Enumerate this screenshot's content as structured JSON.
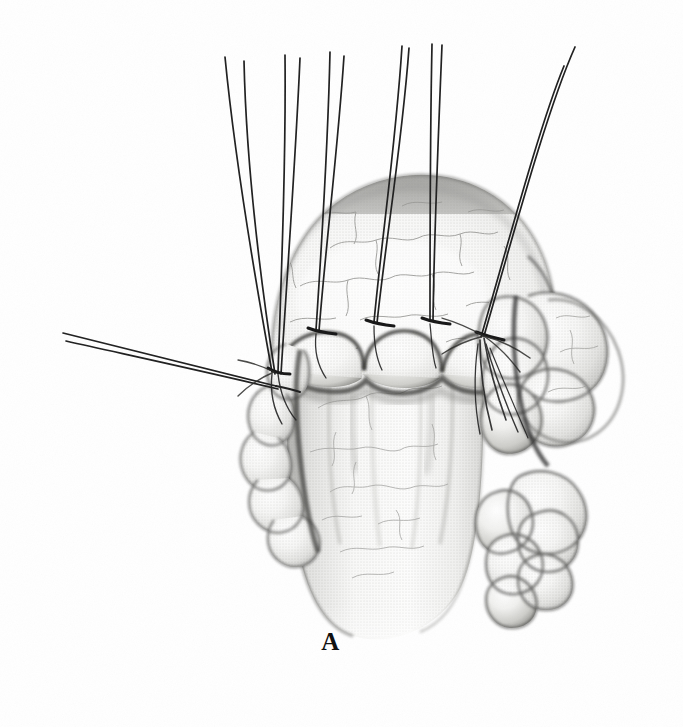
{
  "figure": {
    "kind": "medical-illustration",
    "modality": "grayscale stipple / halftone surgical drawing",
    "background_color": "#ffffff",
    "ink_color": "#1a1a1a",
    "tissue_light": "#f4f4f2",
    "tissue_mid": "#c9c9c6",
    "tissue_shadow": "#8d8d8a",
    "vessel_color": "#9a9a9a",
    "suture_color": "#222222"
  },
  "panel": {
    "label": "A",
    "label_position": "bottom-center"
  },
  "anatomy": {
    "parts": [
      {
        "id": "dome",
        "name": "dome-shaped-organ",
        "description": "Large rounded hollow viscus occupying the upper half, finely stippled with branching surface vessels"
      },
      {
        "id": "tube",
        "name": "tubular-segment",
        "description": "Vertical tubular structure descending below the suture line, pale with fine vascular web"
      },
      {
        "id": "fat-left",
        "name": "left-lobulated-fat",
        "description": "Cluster of rounded lobules along the left margin of the junction"
      },
      {
        "id": "fat-right-upper",
        "name": "right-upper-lobulated-fat",
        "description": "Large lobulated fatty mass at the upper right of the junction"
      },
      {
        "id": "fat-right-lower",
        "name": "right-lower-lobulated-fat",
        "description": "Grape-like cluster of lobules lower on the right side"
      },
      {
        "id": "anastomosis",
        "name": "anastomotic-suture-line",
        "description": "Scalloped junction line with bulging tissue between successive suture bites"
      }
    ]
  },
  "sutures": {
    "count": 6,
    "style": "paired-limb monofilament strands, each pair knotted at a tissue bite",
    "items": [
      {
        "id": "suture-1",
        "name": "left-lateral-traction-suture",
        "orientation": "near-horizontal to the left",
        "knot": {
          "x": 276,
          "y": 372
        }
      },
      {
        "id": "suture-2",
        "name": "left-traction-suture",
        "orientation": "steep up-left",
        "knot": {
          "x": 272,
          "y": 370
        }
      },
      {
        "id": "suture-3",
        "name": "left-mid-traction-suture",
        "orientation": "up and slightly left",
        "knot": {
          "x": 316,
          "y": 330
        }
      },
      {
        "id": "suture-4",
        "name": "central-traction-suture",
        "orientation": "vertical",
        "knot": {
          "x": 374,
          "y": 322
        }
      },
      {
        "id": "suture-5",
        "name": "right-mid-traction-suture",
        "orientation": "vertical",
        "knot": {
          "x": 430,
          "y": 320
        }
      },
      {
        "id": "suture-6",
        "name": "right-lateral-traction-suture",
        "orientation": "steep up-right",
        "knot": {
          "x": 484,
          "y": 336
        }
      }
    ]
  }
}
